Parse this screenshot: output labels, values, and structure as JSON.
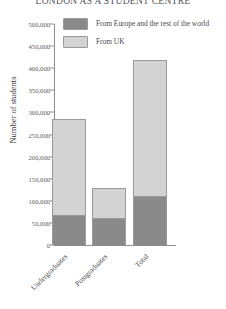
{
  "chart_data": {
    "type": "bar",
    "title": "LONDON AS A STUDENT CENTRE",
    "xlabel": "",
    "ylabel": "Number of students",
    "categories": [
      "Undergraduates",
      "Postgraduates",
      "Total"
    ],
    "series": [
      {
        "name": "From Europe and the rest of the world",
        "color": "#8a8a8a",
        "values": [
          68000,
          62000,
          110000
        ]
      },
      {
        "name": "From UK",
        "color": "#d3d3d3",
        "values": [
          217000,
          68000,
          308000
        ]
      }
    ],
    "totals": [
      285000,
      130000,
      418000
    ],
    "ylim": [
      0,
      500000
    ],
    "yticks": [
      "0",
      "50,000",
      "100,000",
      "150,000",
      "200,000",
      "250,000",
      "300,000",
      "350,000",
      "400,000",
      "450,000",
      "500,000"
    ],
    "ytick_values": [
      0,
      50000,
      100000,
      150000,
      200000,
      250000,
      300000,
      350000,
      400000,
      450000,
      500000
    ],
    "stacked": true,
    "grid": false,
    "legend_position": "top-left-inside",
    "bar_order_bottom_to_top": [
      "From Europe and the rest of the world",
      "From UK"
    ]
  },
  "legend": {
    "items": [
      {
        "label": "From Europe and the rest of the world",
        "color": "#8a8a8a"
      },
      {
        "label": "From UK",
        "color": "#d3d3d3"
      }
    ]
  },
  "colors": {
    "dark_gray": "#8a8a8a",
    "light_gray": "#d3d3d3",
    "outline": "#9a9a9a",
    "axis": "#8e8e8e",
    "text": "#4a4a4a",
    "background": "#ffffff"
  }
}
